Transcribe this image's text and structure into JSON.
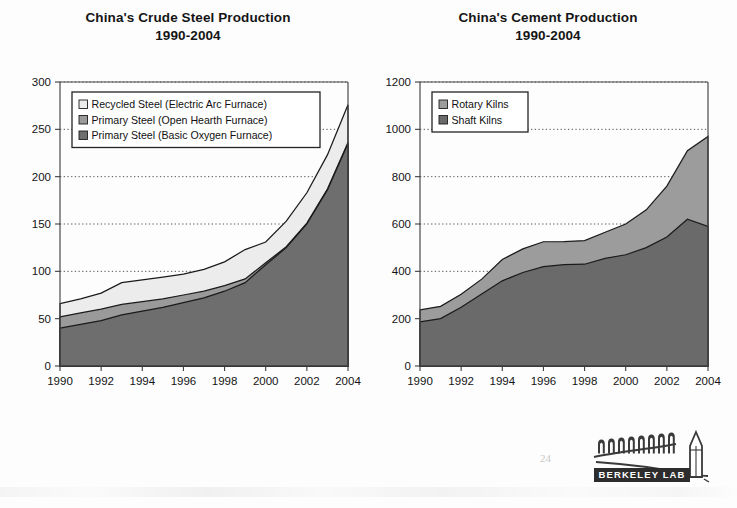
{
  "page": {
    "page_number": "24",
    "logo": {
      "name": "berkeley-lab-logo",
      "wordmark": "BERKELEY LAB"
    }
  },
  "charts": [
    {
      "id": "crude-steel",
      "title_line1": "China's Crude Steel Production",
      "title_line2": "1990-2004",
      "legend_position": "top-left"
    },
    {
      "id": "cement",
      "title_line1": "China's Cement Production",
      "title_line2": "1990-2004",
      "legend_position": "top-left"
    }
  ],
  "chart_data": [
    {
      "type": "area",
      "id": "crude-steel",
      "title": "China's Crude Steel Production 1990-2004",
      "xlabel": "",
      "ylabel": "",
      "stacked": true,
      "grid": true,
      "xlim": [
        1990,
        2004
      ],
      "ylim": [
        0,
        300
      ],
      "yticks": [
        0,
        50,
        100,
        150,
        200,
        250,
        300
      ],
      "xticks": [
        1990,
        1992,
        1994,
        1996,
        1998,
        2000,
        2002,
        2004
      ],
      "x": [
        1990,
        1991,
        1992,
        1993,
        1994,
        1995,
        1996,
        1997,
        1998,
        1999,
        2000,
        2001,
        2002,
        2003,
        2004
      ],
      "series": [
        {
          "name": "Primary Steel (Basic Oxygen Furnace)",
          "color": "#6e6e6e",
          "swatch": "dark-gray",
          "values": [
            40,
            44,
            48,
            54,
            58,
            62,
            67,
            72,
            79,
            88,
            107,
            125,
            150,
            186,
            235
          ]
        },
        {
          "name": "Primary Steel (Open Hearth Furnace)",
          "color": "#9a9a9a",
          "swatch": "medium-gray",
          "values": [
            12,
            12,
            12,
            11,
            10,
            9,
            8,
            7,
            6,
            4,
            2,
            1,
            1,
            1,
            1
          ]
        },
        {
          "name": "Recycled Steel (Electric Arc Furnace)",
          "color": "#ececec",
          "swatch": "white",
          "values": [
            14,
            15,
            17,
            23,
            23,
            23,
            22,
            23,
            25,
            31,
            22,
            27,
            32,
            36,
            40
          ]
        }
      ],
      "legend": [
        "Recycled Steel (Electric Arc Furnace)",
        "Primary Steel (Open Hearth Furnace)",
        "Primary Steel (Basic Oxygen Furnace)"
      ]
    },
    {
      "type": "area",
      "id": "cement",
      "title": "China's Cement Production 1990-2004",
      "xlabel": "",
      "ylabel": "",
      "stacked": true,
      "grid": true,
      "xlim": [
        1990,
        2004
      ],
      "ylim": [
        0,
        1200
      ],
      "yticks": [
        0,
        200,
        400,
        600,
        800,
        1000,
        1200
      ],
      "xticks": [
        1990,
        1992,
        1994,
        1996,
        1998,
        2000,
        2002,
        2004
      ],
      "x": [
        1990,
        1991,
        1992,
        1993,
        1994,
        1995,
        1996,
        1997,
        1998,
        1999,
        2000,
        2001,
        2002,
        2003,
        2004
      ],
      "series": [
        {
          "name": "Shaft Kilns",
          "color": "#6a6a6a",
          "swatch": "dark-gray",
          "values": [
            186,
            200,
            248,
            304,
            360,
            395,
            420,
            428,
            430,
            455,
            470,
            500,
            545,
            620,
            590
          ]
        },
        {
          "name": "Rotary Kilns",
          "color": "#9c9c9c",
          "swatch": "medium-gray",
          "values": [
            51,
            52,
            55,
            63,
            90,
            100,
            105,
            98,
            100,
            110,
            130,
            160,
            215,
            290,
            380
          ]
        }
      ],
      "legend": [
        "Rotary Kilns",
        "Shaft Kilns"
      ]
    }
  ]
}
